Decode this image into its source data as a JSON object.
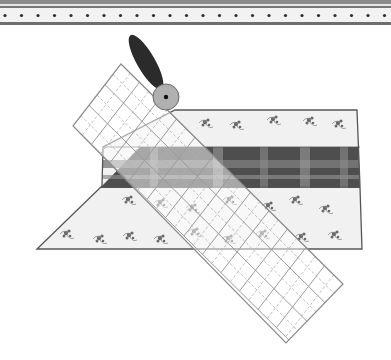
{
  "illustration": {
    "subject": "rotary-cutter-ruler-fabric",
    "colors": {
      "background": "#ffffff",
      "border_stripe": "#6e6e6e",
      "border_band": "#f2f2f2",
      "border_dot": "#2e2e2e",
      "fabric_floral_bg": "#f1f1f1",
      "fabric_outline": "#555555",
      "floral_motif": "#6a6a6a",
      "plaid_dark": "#4a4a4a",
      "plaid_mid": "#7a7a7a",
      "plaid_light": "#a8a8a8",
      "ruler_line": "#9a9a9a",
      "ruler_fill": "rgba(255,255,255,0.55)",
      "cutter_handle": "#2b2b2b",
      "cutter_blade": "#b0b0b0",
      "cutter_hub": "#111111"
    },
    "border": {
      "dot_count": 24,
      "dot_spacing": 16.5
    },
    "ruler": {
      "grid_columns": 3,
      "grid_rows": 12
    }
  }
}
